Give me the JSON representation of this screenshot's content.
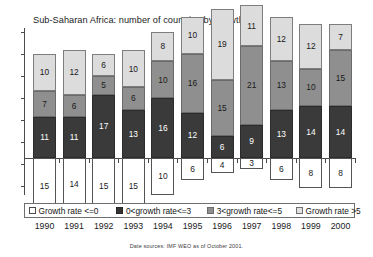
{
  "chart_data": {
    "type": "bar",
    "title": "Sub-Saharan Africa: number of countries by growth rate",
    "xlabel": "",
    "ylabel": "",
    "categories": [
      "1990",
      "1991",
      "1992",
      "1993",
      "1994",
      "1995",
      "1996",
      "1997",
      "1998",
      "1999",
      "2000"
    ],
    "stacked": true,
    "diverging": true,
    "note": "The 'Growth rate <=0' series is plotted downward below a zero baseline; the other three series stack upward.",
    "series": [
      {
        "name": "Growth rate <=0",
        "direction": "below-axis",
        "color": "#ffffff",
        "values": [
          15,
          14,
          15,
          15,
          10,
          6,
          4,
          3,
          6,
          8,
          8
        ]
      },
      {
        "name": "0<growth rate<=3",
        "direction": "above-axis",
        "color": "#3a3a3a",
        "values": [
          11,
          11,
          17,
          13,
          16,
          12,
          6,
          9,
          13,
          14,
          14
        ]
      },
      {
        "name": "3<growth rate<=5",
        "direction": "above-axis",
        "color": "#8f8f8f",
        "values": [
          7,
          6,
          5,
          6,
          10,
          16,
          15,
          21,
          13,
          10,
          15
        ]
      },
      {
        "name": "Growth rate >5",
        "direction": "above-axis",
        "color": "#dcdcdc",
        "values": [
          10,
          12,
          6,
          10,
          8,
          10,
          19,
          11,
          12,
          12,
          7
        ]
      }
    ],
    "axis_ranges": {
      "below_max": 16,
      "above_max": 34
    },
    "grid": false,
    "legend_position": "bottom"
  },
  "legend": {
    "items": [
      {
        "label": "Growth rate <=0",
        "swatch": "sw0"
      },
      {
        "label": "0<growth rate<=3",
        "swatch": "sw1"
      },
      {
        "label": "3<growth rate<=5",
        "swatch": "sw2"
      },
      {
        "label": "Growth rate >5",
        "swatch": "sw3"
      }
    ]
  },
  "footer": {
    "source": "Date sources: IMF WEO as of October 2001."
  }
}
